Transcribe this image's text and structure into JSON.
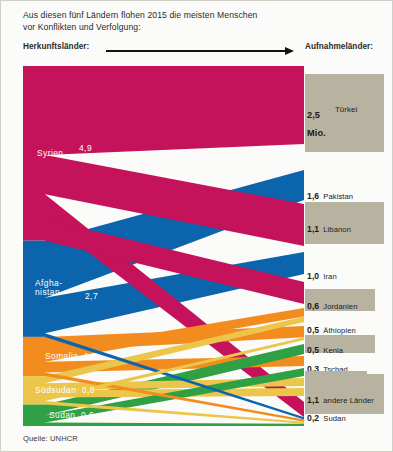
{
  "header": {
    "line1": "Aus diesen fünf Ländern flohen 2015 die meisten Menschen",
    "line2": "vor Konflikten und Verfolgung:",
    "source_caption": "Herkunftsländer:",
    "dest_caption": "Aufnahmeländer:",
    "arrow_icon": "right-arrow-icon"
  },
  "footer": {
    "source": "Quelle: UNHCR"
  },
  "colors": {
    "syria": "#C4135A",
    "afghanistan": "#0C64AC",
    "somalia": "#F28C1E",
    "south_sudan": "#EBC64B",
    "sudan": "#2FA043",
    "dest_bar": "#b7b3a0",
    "background": "#fbfbf9",
    "text": "#2d2a26"
  },
  "chart_data": {
    "type": "sankey",
    "title": "Aus diesen fünf Ländern flohen 2015 die meisten Menschen vor Konflikten und Verfolgung",
    "unit": "Millionen Menschen",
    "sources": [
      {
        "name": "Syrien",
        "value": 4.9,
        "value_label": "4,9",
        "unit_label": "Mio.",
        "color": "#C4135A",
        "two_line_name": false
      },
      {
        "name": "Afghanistan",
        "value": 2.7,
        "value_label": "2,7",
        "unit_label": "",
        "color": "#0C64AC",
        "two_line_name": true,
        "name_line1": "Afgha-",
        "name_line2": "nistan"
      },
      {
        "name": "Somalia",
        "value": 1.1,
        "value_label": "1,1",
        "unit_label": "",
        "color": "#F28C1E",
        "two_line_name": false
      },
      {
        "name": "Südsudan",
        "value": 0.8,
        "value_label": "0,8",
        "unit_label": "",
        "color": "#EBC64B",
        "two_line_name": false
      },
      {
        "name": "Sudan",
        "value": 0.6,
        "value_label": "0,6",
        "unit_label": "",
        "color": "#2FA043",
        "two_line_name": false
      }
    ],
    "destinations": [
      {
        "name": "Türkei",
        "value": 2.5,
        "value_label": "2,5",
        "unit_label": "Mio.",
        "shaded": true
      },
      {
        "name": "Pakistan",
        "value": 1.6,
        "value_label": "1,6",
        "unit_label": "",
        "shaded": false
      },
      {
        "name": "Libanon",
        "value": 1.1,
        "value_label": "1,1",
        "unit_label": "",
        "shaded": true
      },
      {
        "name": "Iran",
        "value": 1.0,
        "value_label": "1,0",
        "unit_label": "",
        "shaded": false
      },
      {
        "name": "Jordanien",
        "value": 0.6,
        "value_label": "0,6",
        "unit_label": "",
        "shaded": true
      },
      {
        "name": "Äthiopien",
        "value": 0.5,
        "value_label": "0,5",
        "unit_label": "",
        "shaded": false
      },
      {
        "name": "Kenia",
        "value": 0.5,
        "value_label": "0,5",
        "unit_label": "",
        "shaded": true
      },
      {
        "name": "Tschad",
        "value": 0.3,
        "value_label": "0,3",
        "unit_label": "",
        "shaded": false
      },
      {
        "name": "Jemen",
        "value": 0.3,
        "value_label": "0,3",
        "unit_label": "",
        "shaded": true
      },
      {
        "name": "Südsudan",
        "value": 0.2,
        "value_label": "0,2",
        "unit_label": "",
        "shaded": false
      },
      {
        "name": "Uganda",
        "value": 0.2,
        "value_label": "0,2",
        "unit_label": "",
        "shaded": true
      },
      {
        "name": "Sudan",
        "value": 0.2,
        "value_label": "0,2",
        "unit_label": "",
        "shaded": false
      },
      {
        "name": "andere Länder",
        "value": 1.1,
        "value_label": "1,1",
        "unit_label": "",
        "shaded": true
      }
    ],
    "flows": [
      {
        "source": "Syrien",
        "target": "Türkei",
        "value": 2.5
      },
      {
        "source": "Syrien",
        "target": "Libanon",
        "value": 1.1
      },
      {
        "source": "Syrien",
        "target": "Jordanien",
        "value": 0.6
      },
      {
        "source": "Syrien",
        "target": "andere Länder",
        "value": 0.7
      },
      {
        "source": "Afghanistan",
        "target": "Pakistan",
        "value": 1.6
      },
      {
        "source": "Afghanistan",
        "target": "Iran",
        "value": 1.0
      },
      {
        "source": "Afghanistan",
        "target": "andere Länder",
        "value": 0.1
      },
      {
        "source": "Somalia",
        "target": "Äthiopien",
        "value": 0.3
      },
      {
        "source": "Somalia",
        "target": "Kenia",
        "value": 0.4
      },
      {
        "source": "Somalia",
        "target": "Jemen",
        "value": 0.3
      },
      {
        "source": "Somalia",
        "target": "andere Länder",
        "value": 0.1
      },
      {
        "source": "Südsudan",
        "target": "Äthiopien",
        "value": 0.2
      },
      {
        "source": "Südsudan",
        "target": "Kenia",
        "value": 0.1
      },
      {
        "source": "Südsudan",
        "target": "Uganda",
        "value": 0.2
      },
      {
        "source": "Südsudan",
        "target": "Sudan",
        "value": 0.2
      },
      {
        "source": "Südsudan",
        "target": "andere Länder",
        "value": 0.1
      },
      {
        "source": "Sudan",
        "target": "Tschad",
        "value": 0.3
      },
      {
        "source": "Sudan",
        "target": "Südsudan",
        "value": 0.2
      },
      {
        "source": "Sudan",
        "target": "andere Länder",
        "value": 0.1
      }
    ]
  }
}
